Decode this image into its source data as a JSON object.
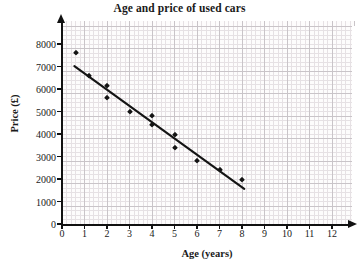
{
  "chart_data": {
    "type": "scatter",
    "title": "Age and price of used cars",
    "xlabel": "Age (years)",
    "ylabel": "Price (£)",
    "xlim": [
      0,
      12.8
    ],
    "ylim": [
      0,
      8800
    ],
    "xticks": [
      0,
      1,
      2,
      3,
      4,
      5,
      6,
      7,
      8,
      9,
      10,
      11,
      12
    ],
    "yticks": [
      0,
      1000,
      2000,
      3000,
      4000,
      5000,
      6000,
      7000,
      8000
    ],
    "xtick_labels": [
      "0",
      "1",
      "2",
      "3",
      "4",
      "5",
      "6",
      "7",
      "8",
      "9",
      "10",
      "11",
      "12"
    ],
    "ytick_labels": [
      "0",
      "1000",
      "2000",
      "3000",
      "4000",
      "5000",
      "6000",
      "7000",
      "8000"
    ],
    "grid": true,
    "grid_minor_step_x": 0.2,
    "grid_minor_step_y": 200,
    "grid_major_step_x": 1,
    "grid_major_step_y": 1000,
    "legend": null,
    "marker_shape": "diamond",
    "marker_color": "#141414",
    "points": [
      {
        "x": 0.6,
        "y": 7600
      },
      {
        "x": 1.2,
        "y": 6600
      },
      {
        "x": 2.0,
        "y": 6150
      },
      {
        "x": 2.0,
        "y": 5600
      },
      {
        "x": 3.0,
        "y": 5000
      },
      {
        "x": 4.0,
        "y": 4800
      },
      {
        "x": 4.0,
        "y": 4400
      },
      {
        "x": 5.0,
        "y": 3950
      },
      {
        "x": 5.0,
        "y": 3400
      },
      {
        "x": 6.0,
        "y": 2780
      },
      {
        "x": 7.0,
        "y": 2380
      },
      {
        "x": 8.0,
        "y": 1950
      }
    ],
    "trend_line": {
      "label": "line of best fit",
      "color": "#141414",
      "x_start": 0.55,
      "y_start": 7020,
      "x_end": 8.1,
      "y_end": 1560
    },
    "axis_color": "#111111",
    "background_color": "#fdfcfc",
    "grid_major_color": "#c9c4c8",
    "grid_minor_color": "#e6e1e4"
  }
}
